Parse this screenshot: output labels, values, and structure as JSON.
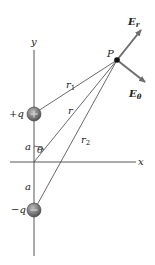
{
  "diagram": {
    "type": "electric-dipole-field-geometry",
    "axes": {
      "x_label": "x",
      "y_label": "y"
    },
    "charges": [
      {
        "label": "+q",
        "sign": "+",
        "position": "upper"
      },
      {
        "label": "−q",
        "sign": "−",
        "position": "lower"
      }
    ],
    "point": {
      "label": "P"
    },
    "distances": {
      "r1": "r",
      "r1_sub": "1",
      "r": "r",
      "r2": "r",
      "r2_sub": "2",
      "a_upper": "a",
      "a_lower": "a"
    },
    "angle": {
      "label": "θ"
    },
    "field_vectors": {
      "radial": {
        "base": "E",
        "sub": "r"
      },
      "angular": {
        "base": "E",
        "sub": "θ"
      }
    },
    "colors": {
      "line": "#444444",
      "arrow": "#6e6e6e",
      "charge_fill": "#7a7a7a",
      "charge_dark": "#4a4a4a",
      "point": "#111111"
    }
  }
}
